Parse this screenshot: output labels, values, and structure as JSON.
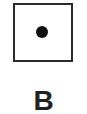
{
  "figure": {
    "label": "B",
    "shape": "square",
    "marker": "dot",
    "colors": {
      "border": "#2b2b2b",
      "dot": "#111111",
      "label": "#222222",
      "background": "#ffffff"
    }
  }
}
